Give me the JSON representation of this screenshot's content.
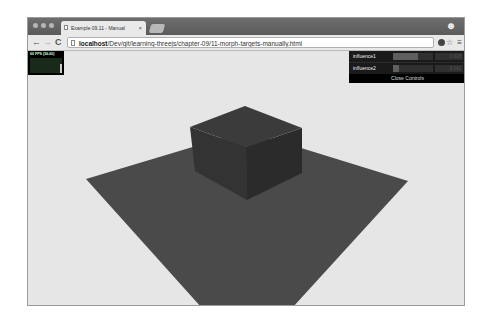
{
  "browser": {
    "tab_title": "Example 09.11 - Manual",
    "tab_close": "×",
    "url_host": "localhost",
    "url_path": "/Dev/git/learning-threejs/chapter-09/11-morph-targets-manually.html",
    "nav": {
      "back": "←",
      "forward": "→",
      "reload": "C"
    },
    "star": "☆",
    "menu": "≡",
    "profile": "☻"
  },
  "stats": {
    "fps_label": "60 FPS (56-60)"
  },
  "gui": {
    "controls": [
      {
        "label": "influence1",
        "value": "0.628",
        "fraction": 0.628
      },
      {
        "label": "influence2",
        "value": "0.141",
        "fraction": 0.141
      }
    ],
    "close_label": "Close Controls"
  },
  "scene": {
    "background": "#e6e6e6",
    "plane_color": "#4a4a4a",
    "cube_top_color": "#3a3a3a",
    "cube_left_color": "#333333",
    "cube_right_color": "#2b2b2b"
  }
}
